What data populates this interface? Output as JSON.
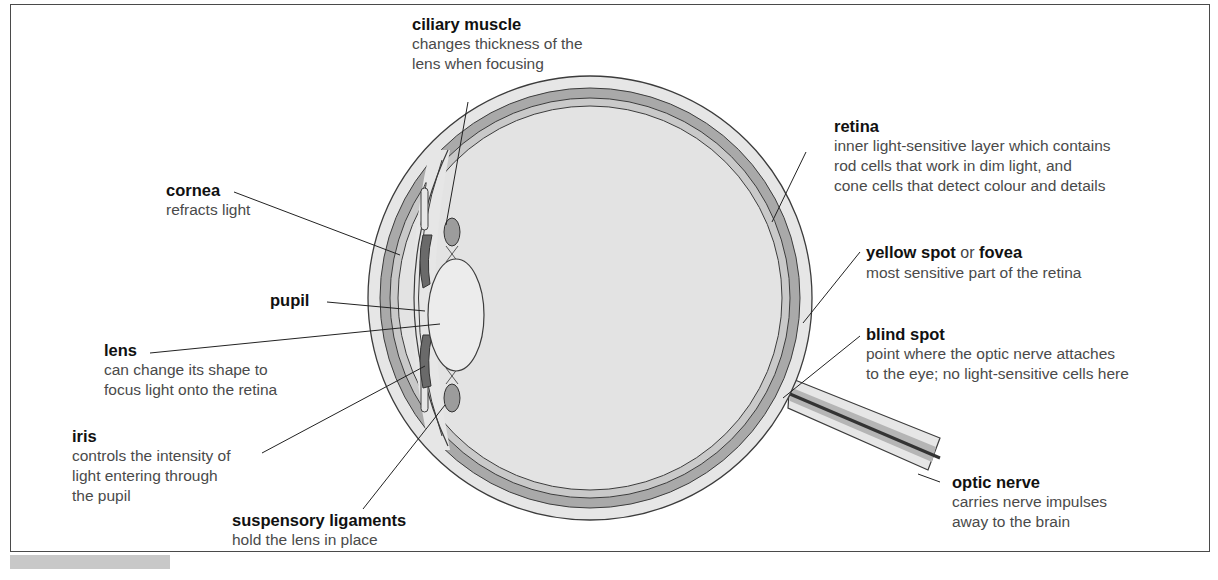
{
  "diagram": {
    "colors": {
      "sclera": "#e6e6e6",
      "choroid": "#a9a9a9",
      "retina": "#c9c9c9",
      "vitreous": "#e3e3e3",
      "lens": "#ececec",
      "iris": "#6a6a6a",
      "ciliary_muscle": "#9c9c9c",
      "outline": "#3c3c3c"
    },
    "labels": {
      "ciliary_muscle": {
        "title": "ciliary muscle",
        "desc": "changes thickness of the\nlens when focusing"
      },
      "cornea": {
        "title": "cornea",
        "desc": "refracts light"
      },
      "pupil": {
        "title": "pupil"
      },
      "lens": {
        "title": "lens",
        "desc": "can change its shape to\nfocus light onto the retina"
      },
      "iris": {
        "title": "iris",
        "desc": "controls the intensity of\nlight entering through\nthe pupil"
      },
      "suspensory_ligaments": {
        "title": "suspensory ligaments",
        "desc": "hold the lens in place"
      },
      "retina": {
        "title": "retina",
        "desc": "inner light-sensitive layer which contains\nrod cells that work in dim light, and\ncone cells that detect colour and details"
      },
      "fovea": {
        "title_a": "yellow spot",
        "or": " or ",
        "title_b": "fovea",
        "desc": "most sensitive part of the retina"
      },
      "blind_spot": {
        "title": "blind spot",
        "desc": "point where the optic nerve attaches\nto the eye; no light-sensitive cells here"
      },
      "optic_nerve": {
        "title": "optic nerve",
        "desc": "carries nerve impulses\naway to the brain"
      }
    }
  }
}
